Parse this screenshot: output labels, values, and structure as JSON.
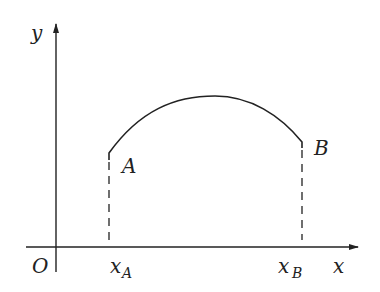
{
  "diagram": {
    "axes": {
      "x_label": "x",
      "y_label": "y",
      "origin_label": "O"
    },
    "points": {
      "A": {
        "label": "A",
        "tick_label": "x",
        "tick_sub": "A"
      },
      "B": {
        "label": "B",
        "tick_label": "x",
        "tick_sub": "B"
      }
    },
    "colors": {
      "stroke": "#222222",
      "background": "#ffffff"
    }
  }
}
